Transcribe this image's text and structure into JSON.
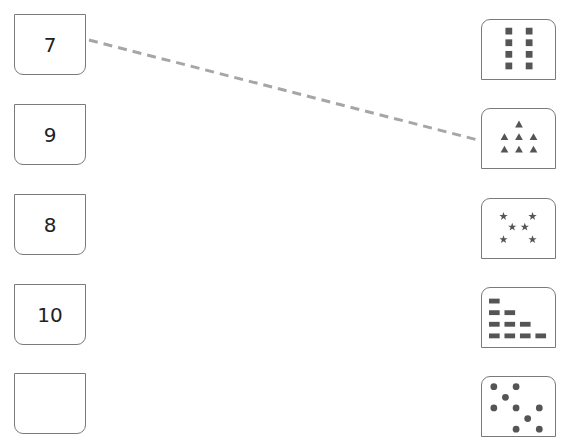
{
  "number_cards": [
    {
      "label": "7",
      "top": 14
    },
    {
      "label": "9",
      "top": 104
    },
    {
      "label": "8",
      "top": 194
    },
    {
      "label": "10",
      "top": 284
    },
    {
      "label": "",
      "top": 373
    }
  ],
  "picture_cards": [
    {
      "shape": "square",
      "count": 8,
      "top": 19
    },
    {
      "shape": "triangle",
      "count": 7,
      "top": 108
    },
    {
      "shape": "star",
      "count": 6,
      "top": 198
    },
    {
      "shape": "rectangle",
      "count": 10,
      "top": 287
    },
    {
      "shape": "circle",
      "count": 9,
      "top": 376
    }
  ],
  "connections": [
    {
      "from": "7",
      "to_index": 1
    }
  ],
  "colors": {
    "border": "#7a7a7a",
    "shape_fill": "#555555",
    "dashed_line": "#a6a6a6"
  }
}
